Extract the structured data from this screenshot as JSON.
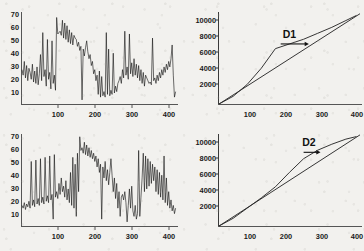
{
  "figure": {
    "background_color": "#f2f1ee",
    "trace_color": "#121212",
    "axis_color": "#555555",
    "annotation_color": "#111111",
    "panel_layout": "2x2"
  },
  "chart_data": [
    {
      "panel_id": "top-left",
      "type": "line",
      "title": "",
      "xlabel": "",
      "ylabel": "",
      "xlim": [
        0,
        400
      ],
      "ylim": [
        5,
        72
      ],
      "xticks": [
        100,
        200,
        300,
        400
      ],
      "yticks": [
        10,
        20,
        30,
        40,
        50,
        60,
        70
      ],
      "grid": false,
      "legend_position": "none",
      "series": [
        {
          "name": "signal-1",
          "x": [
            0,
            3,
            6,
            9,
            12,
            15,
            18,
            21,
            24,
            27,
            30,
            33,
            36,
            39,
            42,
            45,
            48,
            51,
            54,
            57,
            60,
            63,
            66,
            69,
            72,
            75,
            78,
            81,
            84,
            87,
            90,
            93,
            96,
            99,
            102,
            105,
            108,
            111,
            114,
            117,
            120,
            123,
            126,
            129,
            132,
            135,
            138,
            141,
            144,
            147,
            150,
            153,
            156,
            159,
            162,
            165,
            168,
            171,
            174,
            177,
            180,
            183,
            186,
            189,
            192,
            195,
            198,
            201,
            204,
            207,
            210,
            213,
            216,
            219,
            222,
            225,
            228,
            231,
            234,
            237,
            240,
            243,
            246,
            249,
            252,
            255,
            258,
            261,
            264,
            267,
            270,
            273,
            276,
            279,
            282,
            285,
            288,
            291,
            294,
            297,
            300,
            303,
            306,
            309,
            312,
            315,
            318,
            321,
            324,
            327,
            330,
            333,
            336,
            339,
            342,
            345,
            348,
            351,
            354,
            357,
            360,
            363,
            366,
            369,
            372,
            375,
            378,
            381,
            384,
            387,
            390,
            393,
            396,
            399
          ],
          "values": [
            30,
            26,
            36,
            24,
            33,
            22,
            31,
            28,
            23,
            34,
            21,
            29,
            20,
            32,
            19,
            27,
            41,
            22,
            57,
            25,
            30,
            18,
            52,
            23,
            28,
            16,
            51,
            20,
            26,
            15,
            68,
            56,
            57,
            58,
            55,
            66,
            53,
            64,
            52,
            62,
            50,
            59,
            49,
            57,
            48,
            55,
            53,
            52,
            47,
            50,
            44,
            47,
            8,
            45,
            40,
            46,
            51,
            43,
            38,
            41,
            33,
            36,
            27,
            30,
            22,
            26,
            12,
            29,
            10,
            25,
            11,
            14,
            10,
            57,
            12,
            45,
            11,
            15,
            12,
            42,
            13,
            18,
            14,
            20,
            22,
            25,
            20,
            30,
            24,
            58,
            26,
            32,
            23,
            56,
            27,
            35,
            25,
            38,
            26,
            34,
            24,
            33,
            22,
            30,
            20,
            28,
            18,
            26,
            24,
            22,
            20,
            21,
            19,
            53,
            22,
            24,
            20,
            26,
            22,
            28,
            24,
            30,
            26,
            32,
            28,
            34,
            30,
            36,
            32,
            38,
            48,
            26,
            10,
            14
          ]
        }
      ]
    },
    {
      "panel_id": "top-right",
      "type": "line",
      "title": "",
      "xlabel": "",
      "ylabel": "",
      "xlim": [
        0,
        400
      ],
      "ylim": [
        0,
        10800
      ],
      "xticks": [
        100,
        200,
        300,
        400
      ],
      "yticks": [
        2000,
        4000,
        6000,
        8000,
        10000
      ],
      "grid": false,
      "legend_position": "none",
      "annotations": [
        {
          "label": "D1",
          "x": 200,
          "y": 7800,
          "arrow_from_x": 175,
          "arrow_from_y": 7050,
          "arrow_to_x": 255,
          "arrow_to_y": 7050
        }
      ],
      "series": [
        {
          "name": "cumulative-observed",
          "x": [
            0,
            40,
            80,
            120,
            160,
            200,
            240,
            280,
            320,
            360,
            390
          ],
          "values": [
            0,
            900,
            2300,
            4200,
            6500,
            7050,
            7600,
            8300,
            9000,
            9800,
            10400
          ]
        },
        {
          "name": "reference-diagonal",
          "x": [
            0,
            400
          ],
          "values": [
            0,
            10600
          ]
        }
      ]
    },
    {
      "panel_id": "bottom-left",
      "type": "line",
      "title": "",
      "xlabel": "",
      "ylabel": "",
      "xlim": [
        0,
        400
      ],
      "ylim": [
        5,
        72
      ],
      "xticks": [
        100,
        200,
        300,
        400
      ],
      "yticks": [
        10,
        20,
        30,
        40,
        50,
        60,
        70
      ],
      "grid": false,
      "legend_position": "none",
      "series": [
        {
          "name": "signal-2",
          "x": [
            0,
            3,
            6,
            9,
            12,
            15,
            18,
            21,
            24,
            27,
            30,
            33,
            36,
            39,
            42,
            45,
            48,
            51,
            54,
            57,
            60,
            63,
            66,
            69,
            72,
            75,
            78,
            81,
            84,
            87,
            90,
            93,
            96,
            99,
            102,
            105,
            108,
            111,
            114,
            117,
            120,
            123,
            126,
            129,
            132,
            135,
            138,
            141,
            144,
            147,
            150,
            153,
            156,
            159,
            162,
            165,
            168,
            171,
            174,
            177,
            180,
            183,
            186,
            189,
            192,
            195,
            198,
            201,
            204,
            207,
            210,
            213,
            216,
            219,
            222,
            225,
            228,
            231,
            234,
            237,
            240,
            243,
            246,
            249,
            252,
            255,
            258,
            261,
            264,
            267,
            270,
            273,
            276,
            279,
            282,
            285,
            288,
            291,
            294,
            297,
            300,
            303,
            306,
            309,
            312,
            315,
            318,
            321,
            324,
            327,
            330,
            333,
            336,
            339,
            342,
            345,
            348,
            351,
            354,
            357,
            360,
            363,
            366,
            369,
            372,
            375,
            378,
            381,
            384,
            387,
            390,
            393,
            396,
            399
          ],
          "values": [
            20,
            18,
            22,
            17,
            21,
            19,
            23,
            18,
            52,
            20,
            24,
            19,
            53,
            21,
            25,
            20,
            54,
            22,
            26,
            21,
            55,
            23,
            27,
            22,
            56,
            24,
            28,
            10,
            57,
            26,
            30,
            25,
            36,
            28,
            40,
            30,
            34,
            26,
            38,
            24,
            32,
            22,
            44,
            20,
            55,
            18,
            50,
            12,
            58,
            30,
            70,
            60,
            62,
            58,
            66,
            57,
            64,
            56,
            62,
            55,
            60,
            54,
            58,
            52,
            56,
            48,
            54,
            44,
            50,
            10,
            48,
            40,
            52,
            38,
            46,
            35,
            44,
            54,
            42,
            30,
            40,
            25,
            36,
            18,
            30,
            12,
            26,
            28,
            24,
            30,
            22,
            8,
            20,
            32,
            18,
            34,
            16,
            12,
            20,
            10,
            14,
            60,
            12,
            26,
            40,
            58,
            30,
            56,
            32,
            54,
            34,
            52,
            36,
            50,
            38,
            48,
            30,
            46,
            28,
            44,
            26,
            42,
            24,
            56,
            22,
            40,
            20,
            30,
            18,
            24,
            16,
            20,
            14,
            18
          ]
        }
      ]
    },
    {
      "panel_id": "bottom-right",
      "type": "line",
      "title": "",
      "xlabel": "",
      "ylabel": "",
      "xlim": [
        0,
        400
      ],
      "ylim": [
        0,
        10800
      ],
      "xticks": [
        100,
        200,
        300,
        400
      ],
      "yticks": [
        2000,
        4000,
        6000,
        8000,
        10000
      ],
      "grid": false,
      "legend_position": "none",
      "annotations": [
        {
          "label": "D2",
          "x": 255,
          "y": 9450,
          "arrow_from_x": 240,
          "arrow_from_y": 8650,
          "arrow_to_x": 288,
          "arrow_to_y": 8650
        }
      ],
      "series": [
        {
          "name": "cumulative-observed",
          "x": [
            0,
            40,
            80,
            120,
            160,
            200,
            240,
            280,
            320,
            360,
            390
          ],
          "values": [
            0,
            900,
            2100,
            3300,
            4600,
            6300,
            7900,
            8900,
            9600,
            10200,
            10500
          ]
        },
        {
          "name": "reference-diagonal",
          "x": [
            0,
            400
          ],
          "values": [
            0,
            10700
          ]
        }
      ]
    }
  ]
}
